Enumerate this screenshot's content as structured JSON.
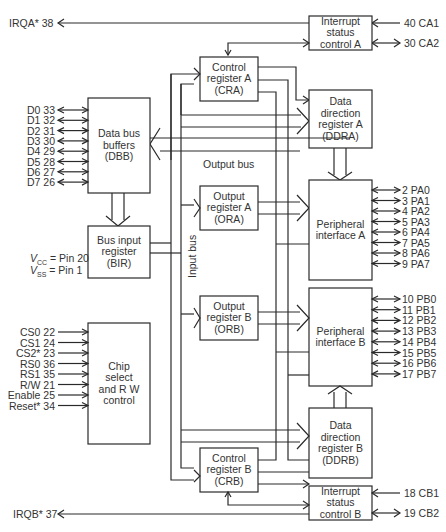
{
  "blocks": {
    "isc_a": [
      "Interrupt",
      "status",
      "control A"
    ],
    "cra": [
      "Control",
      "register A",
      "(CRA)"
    ],
    "ddra": [
      "Data direction",
      "register A",
      "(DDRA)"
    ],
    "dbb": [
      "Data bus",
      "buffers",
      "(DBB)"
    ],
    "ora": [
      "Output",
      "register A",
      "(ORA)"
    ],
    "pia": [
      "Peripheral",
      "interface A"
    ],
    "bir": [
      "Bus input",
      "register",
      "(BIR)"
    ],
    "orb": [
      "Output",
      "register B",
      "(ORB)"
    ],
    "pib": [
      "Peripheral",
      "interface B"
    ],
    "csrw": [
      "Chip",
      "select",
      "and R W",
      "control"
    ],
    "crb": [
      "Control",
      "register B",
      "(CRB)"
    ],
    "ddrb": [
      "Data direction",
      "register B",
      "(DDRB)"
    ],
    "isc_b": [
      "Interrupt",
      "status",
      "control B"
    ]
  },
  "bus_labels": {
    "output_bus": "Output bus",
    "input_bus": "Input bus"
  },
  "pins": {
    "irqa": "IRQA* 38",
    "irqb": "IRQB* 37",
    "ca1": "40 CA1",
    "ca2": "30 CA2",
    "cb1": "18 CB1",
    "cb2": "19 CB2",
    "data": [
      "D0 33",
      "D1 32",
      "D2 31",
      "D3 30",
      "D4 29",
      "D5 28",
      "D6 27",
      "D7 26"
    ],
    "port_a": [
      "2 PA0",
      "3 PA1",
      "4 PA2",
      "5 PA3",
      "6 PA4",
      "7 PA5",
      "8 PA6",
      "9 PA7"
    ],
    "port_b": [
      "10 PB0",
      "11 PB1",
      "12 PB2",
      "13 PB3",
      "14 PB4",
      "15 PB5",
      "16 PB6",
      "17 PB7"
    ],
    "control": [
      "CS0 22",
      "CS1 24",
      "CS2* 23",
      "RS0 36",
      "RS1 35",
      "R/W 21",
      "Enable 25",
      "Reset* 34"
    ]
  },
  "power": {
    "vcc_sym": "V",
    "vcc_sub": "CC",
    "vcc_val": " = Pin 20",
    "vss_sym": "V",
    "vss_sub": "SS",
    "vss_val": " = Pin 1"
  }
}
